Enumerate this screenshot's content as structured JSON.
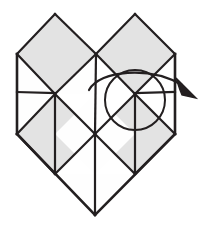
{
  "figure": {
    "type": "origami-instruction-diagram",
    "step_annotation": "curved-arrow-rotate-right",
    "labels": [],
    "text_content": [],
    "colors": {
      "background": "#ffffff",
      "line": "#231f20",
      "facet_shaded": "#e3e3e3",
      "facet_plain": "#fefefe",
      "arrow": "#231f20"
    },
    "stroke": {
      "outline_width": 2.6,
      "crease_width": 2.2,
      "motion_width": 2.0
    },
    "canvas": {
      "width": 210,
      "height": 228
    },
    "geometry": {
      "left_peak": "55,14",
      "right_peak": "135,14",
      "left_edge_x": 17,
      "right_edge_x": 175,
      "shoulder_y": 50,
      "mid_y": 92,
      "side_bottom_y": 133,
      "bottom_point": "95,215",
      "circle_center": "135,100",
      "circle_radius": 30
    },
    "facets": [
      {
        "name": "upper-left-diamond",
        "fill": "shaded",
        "points": "55,14 96,54 55,94 17,54"
      },
      {
        "name": "upper-right-diamond",
        "fill": "shaded",
        "points": "135,14 175,54 135,94 96,54"
      },
      {
        "name": "left-upper-square-top",
        "fill": "plain",
        "points": "17,54 55,94 17,92"
      },
      {
        "name": "left-upper-square-bottom",
        "fill": "plain",
        "points": "17,92 55,94 17,130"
      },
      {
        "name": "lower-left-triangle-a",
        "fill": "shaded",
        "points": "55,94 95,134 55,174 17,134"
      },
      {
        "name": "center-lower-diamond",
        "fill": "plain",
        "points": "95,94 135,134 95,174 55,134"
      },
      {
        "name": "lower-right-diamond",
        "fill": "shaded",
        "points": "135,94 175,134 135,174 95,134"
      },
      {
        "name": "right-upper-square-upper",
        "fill": "plain",
        "points": "135,94 175,92 175,54"
      },
      {
        "name": "bottom-left-tip",
        "fill": "plain",
        "points": "55,174 95,215 95,174"
      },
      {
        "name": "bottom-right-tip",
        "fill": "plain",
        "points": "95,174 95,215 135,174"
      }
    ],
    "motion": {
      "arrow_kind": "curved-rotation-arrow",
      "direction": "clockwise-to-the-right",
      "arrowhead_at": "193,92"
    }
  }
}
